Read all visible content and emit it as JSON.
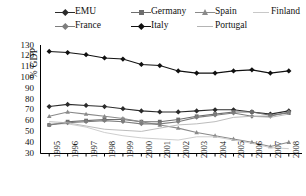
{
  "chart_data": {
    "type": "line",
    "title": "",
    "xlabel": "",
    "ylabel": "% GDP",
    "ylim": [
      30,
      130
    ],
    "yticks": [
      130,
      120,
      110,
      100,
      90,
      80,
      70,
      60,
      50,
      40,
      30
    ],
    "grid": false,
    "legend_position": "top",
    "categories": [
      "1995",
      "1996",
      "1997",
      "1998",
      "1999",
      "2000",
      "2001",
      "2002",
      "2003",
      "2004",
      "2005",
      "2006",
      "2007",
      "2008"
    ],
    "series": [
      {
        "name": "EMU",
        "marker": "diamond",
        "color": "#2b2b2b",
        "values": [
          73,
          75,
          74,
          73,
          71,
          69,
          68,
          68,
          69,
          70,
          70,
          68,
          66,
          69
        ]
      },
      {
        "name": "Germany",
        "marker": "square",
        "color": "#6e6e6e",
        "values": [
          56,
          59,
          60,
          61,
          61,
          59,
          59,
          61,
          64,
          66,
          68,
          68,
          65,
          67
        ]
      },
      {
        "name": "Spain",
        "marker": "triangle",
        "color": "#8a8a8a",
        "values": [
          64,
          68,
          66,
          64,
          62,
          59,
          56,
          53,
          49,
          46,
          43,
          40,
          36,
          40
        ]
      },
      {
        "name": "Finland",
        "marker": "none",
        "color": "#c8c8c8",
        "values": [
          57,
          57,
          54,
          49,
          46,
          44,
          43,
          42,
          45,
          45,
          42,
          39,
          35,
          34
        ]
      },
      {
        "name": "France",
        "marker": "diamond",
        "color": "#7d7d7d",
        "values": [
          56,
          58,
          59,
          60,
          59,
          57,
          57,
          59,
          63,
          65,
          67,
          64,
          64,
          68
        ]
      },
      {
        "name": "Italy",
        "marker": "diamond",
        "color": "#111111",
        "values": [
          124,
          123,
          121,
          118,
          117,
          112,
          111,
          106,
          104,
          104,
          106,
          107,
          104,
          106
        ]
      },
      {
        "name": "Portugal",
        "marker": "none",
        "color": "#b4b4b4",
        "values": [
          59,
          58,
          55,
          52,
          51,
          50,
          53,
          56,
          57,
          59,
          63,
          64,
          63,
          66
        ]
      }
    ]
  },
  "legend": {
    "rows": [
      [
        {
          "label": "EMU",
          "series": 0
        },
        {
          "label": "Germany",
          "series": 1
        },
        {
          "label": "Spain",
          "series": 2
        },
        {
          "label": "Finland",
          "series": 3
        }
      ],
      [
        {
          "label": "France",
          "series": 4
        },
        {
          "label": "Italy",
          "series": 5
        },
        {
          "label": "Portugal",
          "series": 6
        }
      ]
    ]
  }
}
